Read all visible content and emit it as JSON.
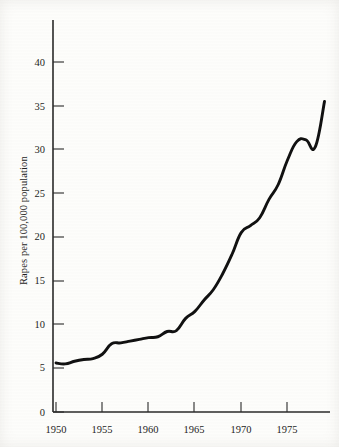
{
  "chart_data": {
    "type": "line",
    "title": "",
    "xlabel": "",
    "ylabel": "Rapes per 100,000 population",
    "xlim": [
      1950,
      1979
    ],
    "ylim": [
      0,
      41
    ],
    "xticks": [
      1950,
      1955,
      1960,
      1965,
      1970,
      1975
    ],
    "xtick_labels": [
      "1950",
      "1955",
      "1960",
      "1965",
      "1970",
      "1975"
    ],
    "yticks": [
      0,
      5,
      10,
      15,
      20,
      25,
      30,
      35,
      40
    ],
    "ytick_labels": [
      "0",
      "5",
      "10",
      "15",
      "20",
      "25",
      "30",
      "35",
      "40"
    ],
    "grid": false,
    "legend": false,
    "legend_position": "none",
    "line_color": "#111111",
    "axis_color": "#2a2a2a",
    "background_color": "#fdfdfb",
    "series": [
      {
        "name": "Rape rate",
        "x": [
          1950,
          1951,
          1952,
          1953,
          1954,
          1955,
          1956,
          1957,
          1958,
          1959,
          1960,
          1961,
          1962,
          1963,
          1964,
          1965,
          1966,
          1967,
          1968,
          1969,
          1970,
          1971,
          1972,
          1973,
          1974,
          1975,
          1976,
          1977,
          1978,
          1979
        ],
        "values": [
          5.6,
          5.5,
          5.8,
          6.0,
          6.1,
          6.6,
          7.8,
          7.9,
          8.1,
          8.3,
          8.5,
          8.6,
          9.2,
          9.3,
          10.7,
          11.5,
          12.8,
          14.0,
          15.8,
          18.0,
          20.5,
          21.3,
          22.2,
          24.3,
          26.0,
          28.8,
          30.9,
          31.1,
          30.3,
          35.5
        ]
      }
    ],
    "annotations": []
  },
  "axis": {
    "y_axis_label": "Rapes per 100,000 population"
  }
}
